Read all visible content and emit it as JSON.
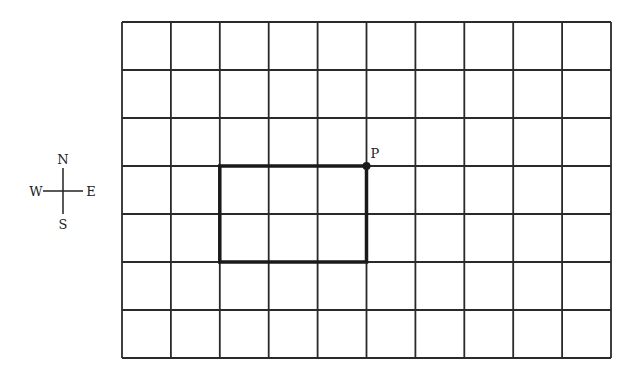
{
  "grid": {
    "columns": 10,
    "rows": 7,
    "left": 122,
    "top": 22,
    "right": 611,
    "bottom": 358,
    "line_color": "#2a2a2a"
  },
  "rectangle": {
    "col_start": 2,
    "col_end": 5,
    "row_start": 3,
    "row_end": 5,
    "stroke_color": "#1a1a1a"
  },
  "point": {
    "label": "P",
    "col": 5,
    "row": 3
  },
  "compass": {
    "north": "N",
    "south": "S",
    "east": "E",
    "west": "W"
  }
}
